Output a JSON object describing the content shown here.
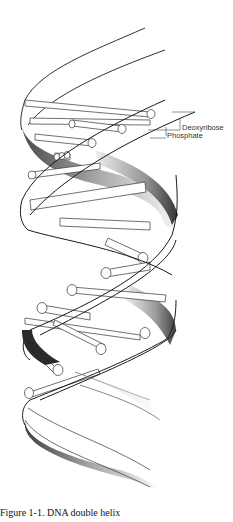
{
  "figure": {
    "title": "DNA double helix",
    "labels": {
      "deoxyribose": "Deoxyribose",
      "phosphate": "Phosphate"
    },
    "caption": "Figure 1-1. DNA double helix",
    "colors": {
      "outline": "#1a1a1a",
      "shade_dark": "#3a3a3a",
      "shade_light": "#e8e8e8",
      "background": "#ffffff"
    }
  }
}
